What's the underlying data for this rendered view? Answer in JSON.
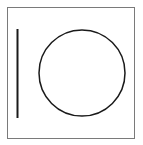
{
  "figure": {
    "frame": {
      "x": 7,
      "y": 7,
      "width": 127,
      "height": 131,
      "stroke": "#7a7a7a"
    },
    "line": {
      "x1": 17.5,
      "y1": 29,
      "x2": 17.5,
      "y2": 118,
      "stroke": "#1a1a1a"
    },
    "circle": {
      "cx": 82,
      "cy": 73,
      "r": 43,
      "stroke": "#1a1a1a"
    }
  }
}
